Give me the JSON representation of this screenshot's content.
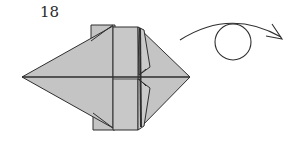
{
  "diagram": {
    "step_number": "18",
    "symbols": [
      {
        "name": "turn-over-arrow",
        "meaning": "turn the model over"
      }
    ],
    "colors": {
      "paper_fill": "#c4c4c4",
      "paper_fill_light": "#cdcdcd",
      "line": "#2e2e2e",
      "background": "#ffffff"
    }
  }
}
